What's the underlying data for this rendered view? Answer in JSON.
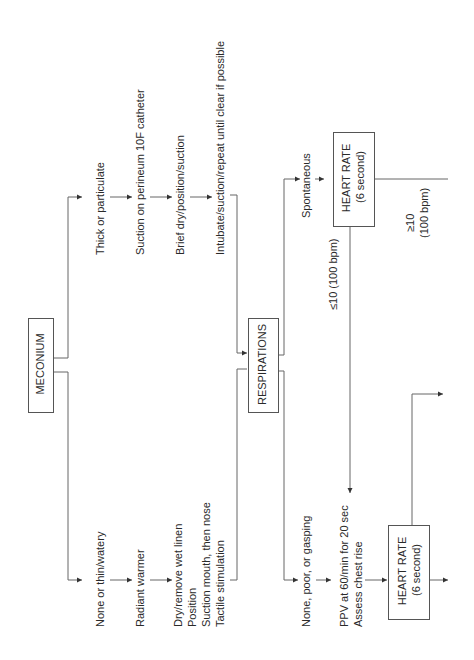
{
  "diagram": {
    "type": "flowchart",
    "orientation": "rotated-90-ccw",
    "nodes": {
      "meconium": {
        "label": "MECONIUM"
      },
      "respirations": {
        "label": "RESPIRATIONS"
      },
      "heart_rate_top": {
        "label": "HEART RATE",
        "sub": "(6 second)"
      },
      "heart_rate_bottom": {
        "label": "HEART RATE",
        "sub": "(6 second)"
      }
    },
    "thick_branch": [
      "Thick or particulate",
      "Suction on perineum 10F catheter",
      "Brief dry/position/suction",
      "Intubate/suction/repeat until clear if possible"
    ],
    "thin_branch": {
      "label": "None or thin/watery",
      "step2": "Radiant warmer",
      "step3": [
        "Dry/remove wet linen",
        "Position",
        "Suction mouth, then nose",
        "Tactile stimulation"
      ]
    },
    "resp_spontaneous": "Spontaneous",
    "resp_poor": "None, poor, or gasping",
    "ppv": [
      "PPV at 60/min for 20 sec",
      "Assess chest rise"
    ],
    "hr_low": "≤10 (100 bpm)",
    "hr_high": [
      "≥10",
      "(100 bpm)"
    ]
  },
  "colors": {
    "line": "#555555",
    "text": "#2a2a2a",
    "background": "#ffffff"
  }
}
